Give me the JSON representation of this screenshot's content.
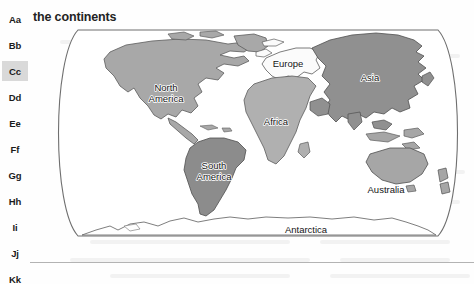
{
  "page": {
    "title": "the continents",
    "background_color": "#fefefe",
    "rule_color": "#b3b3b3"
  },
  "index_rail": {
    "name": "alphabet-index",
    "active_letter": "Cc",
    "active_background": "#d9d9d9",
    "items": [
      {
        "label": "Aa",
        "active": false
      },
      {
        "label": "Bb",
        "active": false
      },
      {
        "label": "Cc",
        "active": true
      },
      {
        "label": "Dd",
        "active": false
      },
      {
        "label": "Ee",
        "active": false
      },
      {
        "label": "Ff",
        "active": false
      },
      {
        "label": "Gg",
        "active": false
      },
      {
        "label": "Hh",
        "active": false
      },
      {
        "label": "Ii",
        "active": false
      },
      {
        "label": "Jj",
        "active": false
      },
      {
        "label": "Kk",
        "active": false
      }
    ]
  },
  "map": {
    "name": "world-map",
    "projection": "robinson-oval",
    "outline_color": "#6f6f6f",
    "ocean_color": "#ffffff",
    "labels": [
      {
        "id": "north-america",
        "text": "North",
        "x": 118,
        "y": 74
      },
      {
        "id": "north-america",
        "text": "America",
        "x": 118,
        "y": 85
      },
      {
        "id": "south-america",
        "text": "South",
        "x": 152,
        "y": 152
      },
      {
        "id": "south-america",
        "text": "America",
        "x": 152,
        "y": 163
      },
      {
        "id": "europe",
        "text": "Europe",
        "x": 243,
        "y": 50
      },
      {
        "id": "africa",
        "text": "Africa",
        "x": 232,
        "y": 121
      },
      {
        "id": "asia",
        "text": "Asia",
        "x": 316,
        "y": 76
      },
      {
        "id": "australia",
        "text": "Australia",
        "x": 332,
        "y": 186
      },
      {
        "id": "antarctica",
        "text": "Antarctica",
        "x": 252,
        "y": 222
      }
    ],
    "continents": [
      {
        "name": "North America",
        "fill": "#a8a8a8"
      },
      {
        "name": "South America",
        "fill": "#8c8c8c"
      },
      {
        "name": "Africa",
        "fill": "#b0b0b0"
      },
      {
        "name": "Europe",
        "fill": "#fbfbfb"
      },
      {
        "name": "Asia",
        "fill": "#909090"
      },
      {
        "name": "Australia",
        "fill": "#a6a6a6"
      },
      {
        "name": "Antarctica",
        "fill": "#ffffff"
      }
    ]
  }
}
